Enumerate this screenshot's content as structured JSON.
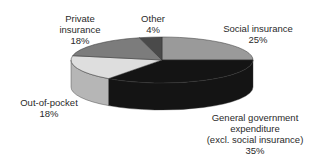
{
  "chart_data": {
    "type": "pie",
    "style": "3d",
    "title": "",
    "slices": [
      {
        "label": "Social insurance",
        "value": 25,
        "display": "25%",
        "color": "#9a9a9a"
      },
      {
        "label": "General government expenditure (excl. social insurance)",
        "value": 35,
        "display": "35%",
        "color": "#141414"
      },
      {
        "label": "Out-of-pocket",
        "value": 18,
        "display": "18%",
        "color": "#dedede"
      },
      {
        "label": "Private insurance",
        "value": 18,
        "display": "18%",
        "color": "#7c7c7c"
      },
      {
        "label": "Other",
        "value": 4,
        "display": "4%",
        "color": "#4a4a4a"
      }
    ],
    "legend": "none",
    "grid": false
  },
  "labels": {
    "social": {
      "line1": "Social insurance",
      "pct": "25%"
    },
    "general": {
      "line1": "General government",
      "line2": "expenditure",
      "line3": "(excl. social insurance)",
      "pct": "35%"
    },
    "oop": {
      "line1": "Out-of-pocket",
      "pct": "18%"
    },
    "private": {
      "line1": "Private",
      "line2": "insurance",
      "pct": "18%"
    },
    "other": {
      "line1": "Other",
      "pct": "4%"
    }
  }
}
